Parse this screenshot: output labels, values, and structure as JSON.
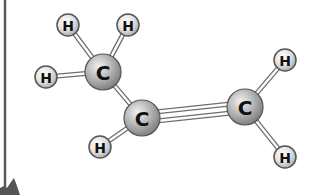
{
  "diagram": {
    "molecule": "propene",
    "colors": {
      "background": "#ffffff",
      "carbon_fill": "#a9a9a9",
      "hydrogen_fill": "#dcdcdc",
      "bond_stroke": "#6e6e6e",
      "bond_fill": "#ffffff",
      "frame_line": "#555555",
      "corner_shape": "#555555"
    },
    "atoms": [
      {
        "id": "H1",
        "element": "H",
        "label": "H",
        "x": 68,
        "y": 25,
        "r": 11
      },
      {
        "id": "H2",
        "element": "H",
        "label": "H",
        "x": 128,
        "y": 25,
        "r": 11
      },
      {
        "id": "H3",
        "element": "H",
        "label": "H",
        "x": 46,
        "y": 77,
        "r": 11
      },
      {
        "id": "C1",
        "element": "C",
        "label": "C",
        "x": 103,
        "y": 72,
        "r": 18
      },
      {
        "id": "C2",
        "element": "C",
        "label": "C",
        "x": 142,
        "y": 118,
        "r": 18
      },
      {
        "id": "H4",
        "element": "H",
        "label": "H",
        "x": 100,
        "y": 147,
        "r": 11
      },
      {
        "id": "C3",
        "element": "C",
        "label": "C",
        "x": 245,
        "y": 107,
        "r": 18
      },
      {
        "id": "H5",
        "element": "H",
        "label": "H",
        "x": 285,
        "y": 60,
        "r": 11
      },
      {
        "id": "H6",
        "element": "H",
        "label": "H",
        "x": 285,
        "y": 157,
        "r": 11
      }
    ],
    "bonds": [
      {
        "from": "C1",
        "to": "H1",
        "order": 1
      },
      {
        "from": "C1",
        "to": "H2",
        "order": 1
      },
      {
        "from": "C1",
        "to": "H3",
        "order": 1
      },
      {
        "from": "C1",
        "to": "C2",
        "order": 1
      },
      {
        "from": "C2",
        "to": "H4",
        "order": 1
      },
      {
        "from": "C2",
        "to": "C3",
        "order": 2
      },
      {
        "from": "C3",
        "to": "H5",
        "order": 1
      },
      {
        "from": "C3",
        "to": "H6",
        "order": 1
      }
    ]
  }
}
